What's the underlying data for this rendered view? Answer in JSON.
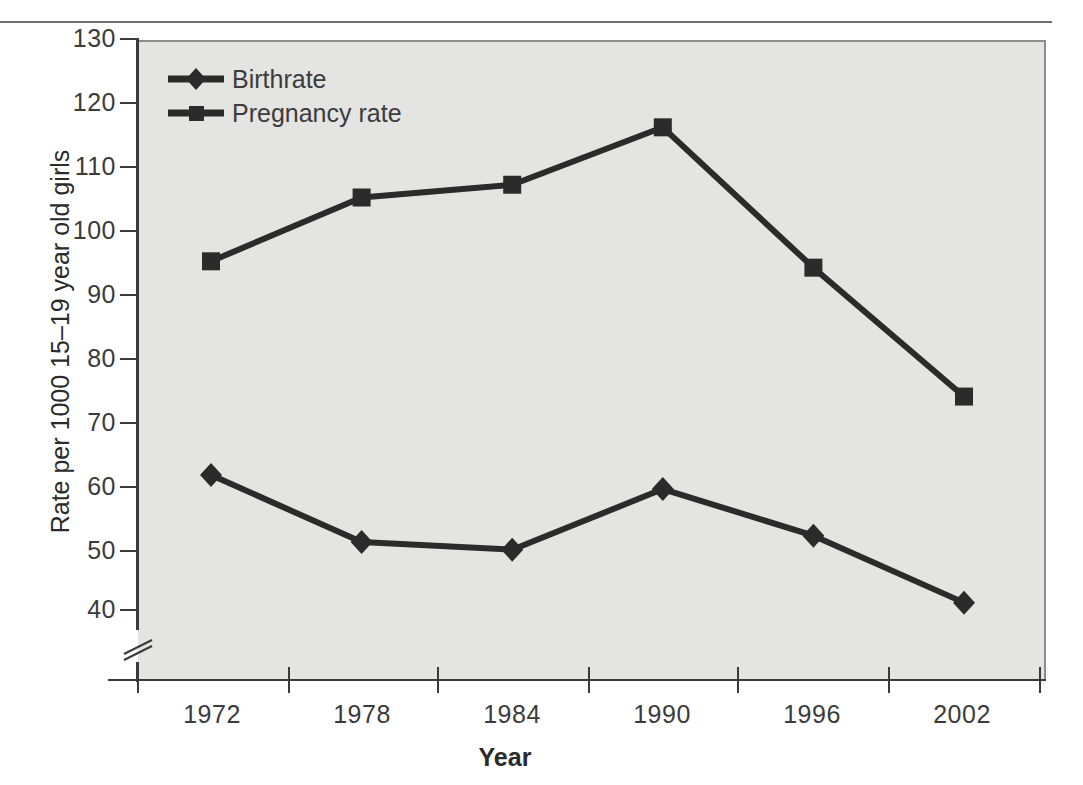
{
  "chart_data": {
    "type": "line",
    "title": "",
    "xlabel": "Year",
    "ylabel": "Rate per 1000 15–19 year old girls",
    "categories": [
      "1972",
      "1978",
      "1984",
      "1990",
      "1996",
      "2002"
    ],
    "x": [
      1972,
      1978,
      1984,
      1990,
      1996,
      2002
    ],
    "series": [
      {
        "name": "Birthrate",
        "marker": "diamond",
        "values": [
          61.5,
          51.0,
          49.8,
          59.3,
          52.0,
          41.5
        ]
      },
      {
        "name": "Pregnancy rate",
        "marker": "square",
        "values": [
          95.0,
          105.0,
          107.0,
          116.0,
          94.0,
          73.8
        ]
      }
    ],
    "ylim": [
      40,
      130
    ],
    "yticks": [
      40,
      50,
      60,
      70,
      80,
      90,
      100,
      110,
      120,
      130
    ],
    "ytick_labels": [
      "40",
      "50",
      "60",
      "70",
      "80",
      "90",
      "100",
      "110",
      "120",
      "130"
    ],
    "xtick_labels": [
      "1972",
      "1978",
      "1984",
      "1990",
      "1996",
      "2002"
    ],
    "grid": false,
    "axis_break": true,
    "legend_position": "top-left",
    "plot_background": "#e4e4e2",
    "series_color": "#2b2b2b"
  },
  "axes": {
    "y_title": "Rate per 1000 15–19 year old girls",
    "x_title": "Year",
    "y_tick_labels": [
      "130",
      "120",
      "110",
      "100",
      "90",
      "80",
      "70",
      "60",
      "50",
      "40"
    ],
    "x_tick_labels": [
      "1972",
      "1978",
      "1984",
      "1990",
      "1996",
      "2002"
    ]
  },
  "legend": {
    "items": [
      {
        "label": "Birthrate",
        "marker": "diamond"
      },
      {
        "label": "Pregnancy rate",
        "marker": "square"
      }
    ]
  }
}
